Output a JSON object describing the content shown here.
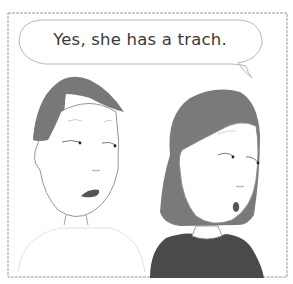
{
  "comic": {
    "speech_bubble": {
      "speaker": "left-character",
      "text": "Yes, she has a trach."
    },
    "characters": [
      {
        "id": "left-character",
        "description": "short-haired person, speaking, looking sideways"
      },
      {
        "id": "right-character",
        "description": "woman with bob haircut and dark top, mouth open in surprise, looking sideways"
      }
    ],
    "colors": {
      "hair": "#7a7a7a",
      "shirt": "#4a4a4a",
      "mouth": "#555555",
      "outline": "#8a8a8a",
      "border": "#9a9a9a",
      "text": "#3a3a3a",
      "background": "#ffffff"
    }
  }
}
